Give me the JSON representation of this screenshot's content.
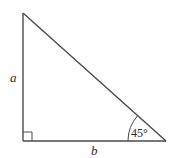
{
  "diagram": {
    "type": "right-triangle",
    "labels": {
      "vertical_side": "a",
      "horizontal_side": "b",
      "angle": "45°"
    },
    "right_angle_marker": true,
    "colors": {
      "stroke": "#4a4a4a",
      "text": "#2b2b2b",
      "background": "#ffffff"
    }
  }
}
